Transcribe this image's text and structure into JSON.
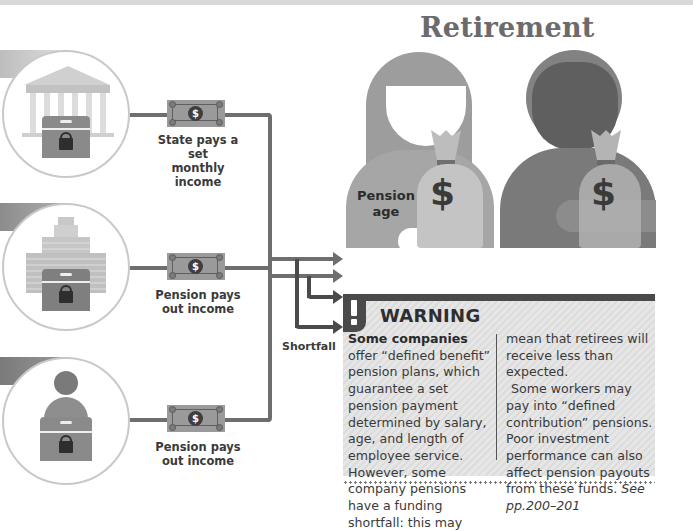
{
  "title": "Retirement",
  "sources": [
    {
      "id": "state",
      "icon": "government-building-icon",
      "caption_line1": "State pays a set",
      "caption_line2": "monthly income"
    },
    {
      "id": "company",
      "icon": "office-building-icon",
      "caption_line1": "Pension pays",
      "caption_line2": "out income"
    },
    {
      "id": "personal",
      "icon": "person-icon",
      "caption_line1": "Pension pays",
      "caption_line2": "out income"
    }
  ],
  "note_symbol": "$",
  "figure": {
    "label_line1": "Pension",
    "label_line2": "age",
    "bag_symbol": "$"
  },
  "shortfall_label": "Shortfall",
  "warning": {
    "title": "WARNING",
    "col1_bold": "Some companies",
    "col1_text": " offer “defined benefit” pension plans, which guarantee a set pension payment determined by salary, age, and length of employee service. However, some company pensions have a funding shortfall: this may",
    "col2_text_a": "mean that retirees will receive less than expected.",
    "col2_text_b": "Some workers may pay into “defined contribution” pensions. Poor investment performance can also affect pension payouts from these funds.",
    "col2_ref": "See pp.200–201"
  },
  "colors": {
    "line": "#6e6e6e",
    "dark": "#4a4a4a",
    "figure_left": "#9b9b9b",
    "figure_right": "#7c7c7c",
    "bag": "#bdbdbd"
  }
}
